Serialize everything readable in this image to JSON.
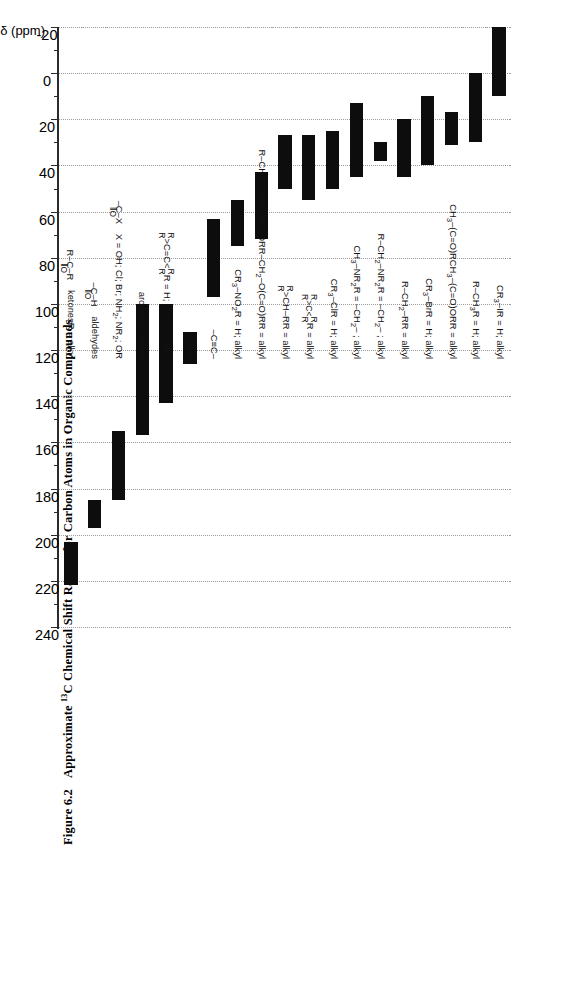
{
  "figure": {
    "number": "Figure 6.2",
    "title_pre": "Approximate ",
    "title_sup": "13",
    "title_post": "C Chemical Shift Ranges for Carbon Atoms in Organic Compounds",
    "full_title": "Figure 6.2   Approximate 13C Chemical Shift Ranges for Carbon Atoms in Organic Compounds"
  },
  "axis": {
    "label": "δ (ppm)",
    "unit": "ppm",
    "symbol": "δ",
    "min": -20,
    "max": 240,
    "tick_major_step": 20,
    "tick_minor_step": 10,
    "direction": "descending",
    "tick_labels": [
      "-20",
      "0",
      "20",
      "40",
      "60",
      "80",
      "100",
      "120",
      "140",
      "160",
      "180",
      "200",
      "220",
      "240"
    ],
    "tick_values": [
      -20,
      0,
      20,
      40,
      60,
      80,
      100,
      120,
      140,
      160,
      180,
      200,
      220,
      240
    ],
    "gridlines": true,
    "grid_color": "#9a9a9a"
  },
  "colors": {
    "bar": "#0d0d0d",
    "grid": "#9a9a9a",
    "separator": "#b9b9b9",
    "axis": "#2b2b2b",
    "background": "#ffffff",
    "text": "#111111"
  },
  "chart_data": {
    "type": "bar",
    "orientation": "vertical-range",
    "title": "Figure 6.2  Approximate 13C Chemical Shift Ranges for Carbon Atoms in Organic Compounds",
    "xlabel": "",
    "ylabel": "δ (ppm)",
    "ylim": [
      -20,
      240
    ],
    "yticks": [
      -20,
      0,
      20,
      40,
      60,
      80,
      100,
      120,
      140,
      160,
      180,
      200,
      220,
      240
    ],
    "grid": true,
    "legend": "none",
    "value_key": "ranges in ppm (start, end)",
    "categories": [
      "CR3-I   R = H; alkyl",
      "R-CH3  R = H; alkyl",
      "CH3-(C=O)R   CH3-(C=O)OR   R = alkyl",
      "CR3-Br  R = H; alkyl",
      "R-CH2-R   R = alkyl",
      "R-CH2-NR2   R = -CH2- ; alkyl",
      "CH3-NR2   R = -CH2- ; alkyl",
      "CR3-Cl  R = H; alkyl",
      "R2C=CR2   R = alkyl",
      "R2C=CH-R   R = alkyl",
      "R-CH2-OH  R-CH2-OR  R-CH2-O(C=O)R  R = alkyl",
      "CR3-NO2   R = H; alkyl",
      "-C≡C-",
      "-C≡N",
      "R2C=C(R)R   R = H; -CH2- ; alkyl",
      "aromatic carbon",
      "-C(=O)-X   X = OH; Cl; Br; NH2; NR2; OR",
      "-C(=O)-H   aldehydes",
      "R-C(=O)-R   ketones   R = alkyl"
    ],
    "ranges": [
      {
        "label": "CR3-I",
        "start": -20,
        "end": 10
      },
      {
        "label": "R-CH3",
        "start": 0,
        "end": 30
      },
      {
        "label": "CH3-(C=O)R / CH3-(C=O)OR",
        "start": 17,
        "end": 31
      },
      {
        "label": "CR3-Br",
        "start": 10,
        "end": 40
      },
      {
        "label": "R-CH2-R",
        "start": 20,
        "end": 45
      },
      {
        "label": "R-CH2-NR2",
        "start": 30,
        "end": 38
      },
      {
        "label": "CH3-NR2",
        "start": 13,
        "end": 45
      },
      {
        "label": "CR3-Cl",
        "start": 25,
        "end": 50
      },
      {
        "label": "R2C=CR2",
        "start": 27,
        "end": 55
      },
      {
        "label": "R2C=CH-R",
        "start": 27,
        "end": 50
      },
      {
        "label": "R-CH2-OH / OR / O(C=O)R",
        "start": 43,
        "end": 72
      },
      {
        "label": "CR3-NO2",
        "start": 55,
        "end": 75
      },
      {
        "label": "-C≡C-",
        "start": 63,
        "end": 97
      },
      {
        "label": "-C≡N",
        "start": 112,
        "end": 126
      },
      {
        "label": "R2C=C(R)R",
        "start": 100,
        "end": 143
      },
      {
        "label": "aromatic carbon",
        "start": 100,
        "end": 157
      },
      {
        "label": "-C(=O)-X",
        "start": 155,
        "end": 185
      },
      {
        "label": "-C(=O)-H aldehydes",
        "start": 185,
        "end": 197
      },
      {
        "label": "R-C(=O)-R ketones",
        "start": 203,
        "end": 222
      }
    ]
  },
  "rows": [
    {
      "id": "cr3-i",
      "formula": "CR<sub>3</sub>–I",
      "cond": "R = H; alkyl",
      "start": -20,
      "end": 10
    },
    {
      "id": "r-ch3",
      "formula": "R–CH<sub>3</sub>",
      "cond": "R = H; alkyl",
      "start": 0,
      "end": 30
    },
    {
      "id": "ch3-co",
      "formula": "CH<sub>3</sub>–(C=O)R",
      "formula2": "CH<sub>3</sub>–(C=O)OR",
      "cond": "R = alkyl",
      "start": 17,
      "end": 31
    },
    {
      "id": "cr3-br",
      "formula": "CR<sub>3</sub>–Br",
      "cond": "R = H; alkyl",
      "start": 10,
      "end": 40
    },
    {
      "id": "r-ch2-r",
      "formula": "R–CH<sub>2</sub>–R",
      "cond": "R = alkyl",
      "start": 20,
      "end": 45
    },
    {
      "id": "r-ch2-nr2",
      "formula": "R–CH<sub>2</sub>–NR<sub>2</sub>",
      "cond": "R = –CH<sub>2</sub>– ; alkyl",
      "start": 30,
      "end": 38
    },
    {
      "id": "ch3-nr2",
      "formula": "CH<sub>3</sub>–NR<sub>2</sub>",
      "cond": "R = –CH<sub>2</sub>– ; alkyl",
      "start": 13,
      "end": 45
    },
    {
      "id": "cr3-cl",
      "formula": "CR<sub>3</sub>–Cl",
      "cond": "R = H; alkyl",
      "start": 25,
      "end": 50
    },
    {
      "id": "r2c-cr2",
      "formula": "STRUCT_R2CCR2",
      "cond": "R = alkyl",
      "start": 27,
      "end": 55
    },
    {
      "id": "r2c-chr",
      "formula": "STRUCT_R2CHR",
      "cond": "R = alkyl",
      "start": 27,
      "end": 50
    },
    {
      "id": "r-ch2-oh",
      "formula": "R–CH<sub>2</sub>–OH",
      "formula2": "R–CH<sub>2</sub>–OR",
      "formula3": "R–CH<sub>2</sub>–O(C=O)R",
      "cond": "R = alkyl",
      "start": 43,
      "end": 72
    },
    {
      "id": "cr3-no2",
      "formula": "CR<sub>3</sub>–NO<sub>2</sub>",
      "cond": "R = H; alkyl",
      "start": 55,
      "end": 75
    },
    {
      "id": "alkyne",
      "formula": "–C≡C–",
      "cond": "",
      "start": 63,
      "end": 97
    },
    {
      "id": "nitrile",
      "formula": "–C≡N",
      "cond": "",
      "start": 112,
      "end": 126
    },
    {
      "id": "alkene",
      "formula": "STRUCT_ALKENE",
      "cond": "R = H; –CH<sub>2</sub>– ; alkyl",
      "start": 100,
      "end": 143
    },
    {
      "id": "aromatic",
      "formula": "aromatic carbon",
      "cond": "",
      "start": 100,
      "end": 157
    },
    {
      "id": "acyl-x",
      "formula": "STRUCT_COX",
      "cond": "X = OH; Cl; Br; NH<sub>2</sub>; NR<sub>2</sub>; OR",
      "start": 155,
      "end": 185
    },
    {
      "id": "aldehyde",
      "formula": "STRUCT_COH",
      "cond": "aldehydes",
      "start": 185,
      "end": 197
    },
    {
      "id": "ketone",
      "formula": "STRUCT_KETONE",
      "cond": "ketones",
      "cond2": "R = alkyl",
      "start": 203,
      "end": 222
    }
  ]
}
